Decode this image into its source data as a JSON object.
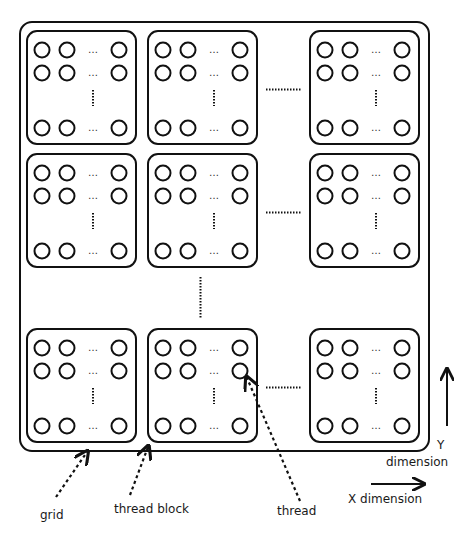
{
  "diagram": {
    "stroke_color": "#111111",
    "background": "#ffffff",
    "grid": {
      "x": 20,
      "y": 22,
      "width": 409,
      "height": 429,
      "radius": 12
    },
    "block_columns_x": [
      27,
      148,
      310
    ],
    "block_rows_y": [
      31,
      154,
      329
    ],
    "block_size": {
      "width": 109,
      "height": 113,
      "radius": 10
    },
    "thread_circle_radius": 7.5,
    "thread_columns_offset": [
      15,
      40,
      92
    ],
    "thread_rows_offset": [
      19,
      42,
      97
    ],
    "ellipsis_glyph": "…",
    "labels": {
      "grid": "grid",
      "thread_block": "thread block",
      "thread": "thread",
      "y_axis_letter": "Y",
      "y_axis_word": "dimension",
      "x_axis": "X dimension"
    }
  }
}
